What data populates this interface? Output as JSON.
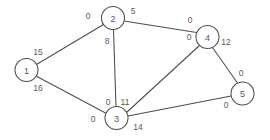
{
  "figure": {
    "title": "",
    "background_color": "#ffffff",
    "line_color": "#4d4d4d",
    "text_color": "#58585a",
    "node_fill": "#ffffff",
    "node_radius": 11.5,
    "width": 270,
    "height": 140
  },
  "chart_data": {
    "type": "diagram",
    "diagram_kind": "undirected-weighted-graph",
    "title": "",
    "nodes": [
      {
        "id": "1",
        "label": "1",
        "x": 26.5,
        "y": 70
      },
      {
        "id": "2",
        "label": "2",
        "x": 113,
        "y": 18
      },
      {
        "id": "3",
        "label": "3",
        "x": 116.5,
        "y": 118
      },
      {
        "id": "4",
        "label": "4",
        "x": 207.5,
        "y": 37
      },
      {
        "id": "5",
        "label": "5",
        "x": 242.5,
        "y": 93.5
      }
    ],
    "edges": [
      {
        "from": "1",
        "to": "2",
        "x1": 36.5,
        "y1": 64.5,
        "x2": 103.5,
        "y2": 24.5
      },
      {
        "from": "1",
        "to": "3",
        "x1": 36,
        "y1": 76,
        "x2": 106.5,
        "y2": 113.5
      },
      {
        "from": "2",
        "to": "3",
        "x1": 113.5,
        "y1": 29.5,
        "x2": 116,
        "y2": 106.5
      },
      {
        "from": "2",
        "to": "4",
        "x1": 124,
        "y1": 21,
        "x2": 196.5,
        "y2": 32.5
      },
      {
        "from": "3",
        "to": "4",
        "x1": 126.5,
        "y1": 112.5,
        "x2": 199.5,
        "y2": 45.5
      },
      {
        "from": "3",
        "to": "5",
        "x1": 128,
        "y1": 116,
        "x2": 231,
        "y2": 96
      },
      {
        "from": "4",
        "to": "5",
        "x1": 212.5,
        "y1": 47.5,
        "x2": 237.5,
        "y2": 83
      }
    ],
    "edge_labels": [
      {
        "text": "15",
        "x": 38,
        "y": 52,
        "edge": "1-2",
        "endpoint": "1"
      },
      {
        "text": "0",
        "x": 88,
        "y": 16,
        "edge": "1-2",
        "endpoint": "2"
      },
      {
        "text": "16",
        "x": 38,
        "y": 88,
        "edge": "1-3",
        "endpoint": "1"
      },
      {
        "text": "0",
        "x": 93,
        "y": 119,
        "edge": "1-3",
        "endpoint": "3"
      },
      {
        "text": "8",
        "x": 107,
        "y": 41,
        "edge": "2-3",
        "endpoint": "2"
      },
      {
        "text": "0",
        "x": 108,
        "y": 102,
        "edge": "2-3",
        "endpoint": "3"
      },
      {
        "text": "5",
        "x": 133,
        "y": 11,
        "edge": "2-4",
        "endpoint": "2"
      },
      {
        "text": "0",
        "x": 190,
        "y": 20,
        "edge": "2-4",
        "endpoint": "4"
      },
      {
        "text": "11",
        "x": 125,
        "y": 102,
        "edge": "3-4",
        "endpoint": "3"
      },
      {
        "text": "0",
        "x": 189,
        "y": 37,
        "edge": "3-4",
        "endpoint": "4"
      },
      {
        "text": "14",
        "x": 138,
        "y": 127,
        "edge": "3-5",
        "endpoint": "3"
      },
      {
        "text": "0",
        "x": 226,
        "y": 105,
        "edge": "3-5",
        "endpoint": "5"
      },
      {
        "text": "12",
        "x": 226,
        "y": 42,
        "edge": "4-5",
        "endpoint": "4"
      },
      {
        "text": "0",
        "x": 241,
        "y": 73,
        "edge": "4-5",
        "endpoint": "5"
      }
    ]
  }
}
